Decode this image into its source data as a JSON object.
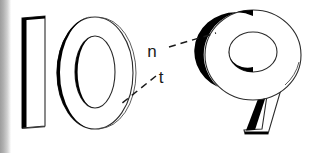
{
  "figure": {
    "background_color": "#ffffff",
    "ink_color": "#000000",
    "scan_edge_color": "#9d9d9d",
    "width": 317,
    "height": 153
  },
  "numerals": [
    {
      "id": "digit-one",
      "glyph": "1",
      "style": "outlined-slab-bar",
      "shadow_side": "left"
    },
    {
      "id": "digit-zero",
      "glyph": "0",
      "style": "outlined-oval-double-ring",
      "shadow_side": "left"
    },
    {
      "id": "digit-nine",
      "glyph": "9",
      "style": "outlined-bowl-with-leg",
      "shadow_side": "left"
    }
  ],
  "grouped_label": "10",
  "annotations": [
    {
      "id": "label-n",
      "text": "n",
      "points_to": "digit-nine",
      "leader": "dashed",
      "direction": "up-right"
    },
    {
      "id": "label-t",
      "text": "t",
      "points_to": "digit-zero",
      "leader": "dashed",
      "direction": "down-left"
    }
  ]
}
